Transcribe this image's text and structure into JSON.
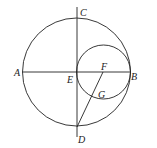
{
  "diagram": {
    "points": {
      "A": {
        "label": "A",
        "x": 14,
        "y": 76
      },
      "B": {
        "label": "B",
        "x": 133,
        "y": 78
      },
      "C": {
        "label": "C",
        "x": 80,
        "y": 14
      },
      "D": {
        "label": "D",
        "x": 78,
        "y": 143
      },
      "E": {
        "label": "E",
        "x": 67,
        "y": 82
      },
      "F": {
        "label": "F",
        "x": 101,
        "y": 70
      },
      "G": {
        "label": "G",
        "x": 98,
        "y": 98
      }
    },
    "big_circle": {
      "cx": 76.5,
      "cy": 72,
      "r": 54
    },
    "small_circle": {
      "cx": 103.5,
      "cy": 72,
      "r": 27
    },
    "stroke_color": "#222222"
  }
}
